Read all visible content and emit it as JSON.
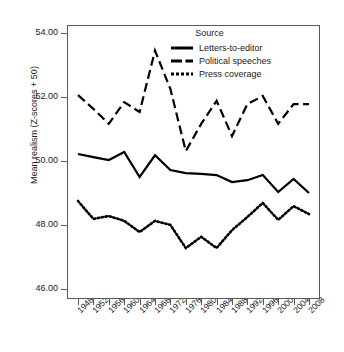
{
  "chart_data": {
    "type": "line",
    "title": "",
    "xlabel": "",
    "ylabel": "Mean realism (Z-scores + 50)",
    "categories": [
      "1948",
      "1952",
      "1956",
      "1960",
      "1964",
      "1968",
      "1972",
      "1976",
      "1980",
      "1984",
      "1988",
      "1992",
      "1996",
      "2000",
      "2004",
      "2008"
    ],
    "ylim": [
      46.0,
      54.0
    ],
    "yticks": [
      "46.00",
      "48.00",
      "50.00",
      "52.00",
      "54.00"
    ],
    "ytick_values": [
      46.0,
      48.0,
      50.0,
      52.0,
      54.0
    ],
    "grid": false,
    "legend_position": "top-right",
    "legend_title": "Source",
    "series": [
      {
        "name": "Letters-to-editor",
        "style": "solid",
        "color": "#000000",
        "values": [
          50.22,
          50.12,
          50.03,
          50.28,
          49.5,
          50.18,
          49.72,
          49.62,
          49.6,
          49.56,
          49.34,
          49.4,
          49.56,
          49.03,
          49.44,
          49.0
        ]
      },
      {
        "name": "Political speeches",
        "style": "dashed",
        "color": "#000000",
        "values": [
          52.06,
          51.63,
          51.16,
          51.84,
          51.53,
          53.45,
          52.25,
          50.31,
          51.16,
          51.88,
          50.78,
          51.78,
          52.03,
          51.16,
          51.78,
          51.78
        ]
      },
      {
        "name": "Press coverage",
        "style": "dotted",
        "color": "#000000",
        "values": [
          48.75,
          48.19,
          48.28,
          48.13,
          47.78,
          48.13,
          48.0,
          47.28,
          47.63,
          47.28,
          47.84,
          48.25,
          48.69,
          48.16,
          48.59,
          48.34
        ]
      }
    ]
  },
  "axis": {
    "ylabel": "Mean realism (Z-scores + 50)"
  }
}
